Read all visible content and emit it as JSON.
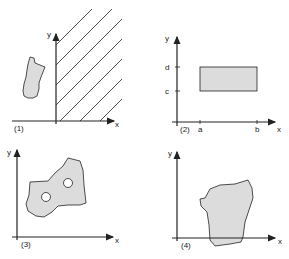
{
  "colors": {
    "ink": "#222222",
    "fill": "#dcdcdc"
  },
  "panels": [
    {
      "id": "1",
      "label": "(1)",
      "x_axis": "x",
      "y_axis": "y",
      "description": "Unbounded hatched region x>=0 and an isolated bounded blob"
    },
    {
      "id": "2",
      "label": "(2)",
      "x_axis": "x",
      "y_axis": "y",
      "ticks_x": [
        "a",
        "b"
      ],
      "ticks_y": [
        "c",
        "d"
      ],
      "description": "Rectangle a<=x<=b, c<=y<=d"
    },
    {
      "id": "3",
      "label": "(3)",
      "x_axis": "x",
      "y_axis": "y",
      "description": "Region with two holes"
    },
    {
      "id": "4",
      "label": "(4)",
      "x_axis": "x",
      "y_axis": "y",
      "description": "Region crossing the x-axis"
    }
  ]
}
